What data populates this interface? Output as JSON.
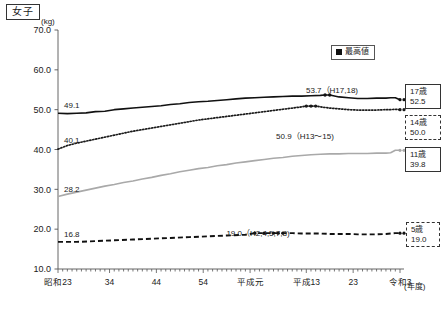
{
  "panel": {
    "title": "女子",
    "y_unit": "(kg)",
    "x_unit": "(年度)"
  },
  "legend": {
    "position": "top-right",
    "items": [
      {
        "label": "最高値",
        "marker": "filled-square",
        "color": "#111111"
      }
    ]
  },
  "end_labels": [
    {
      "id": "box17",
      "age": "17歳",
      "value": "52.5",
      "style": "solid"
    },
    {
      "id": "box14",
      "age": "14歳",
      "value": "50.0",
      "style": "dashed"
    },
    {
      "id": "box11",
      "age": "11歳",
      "value": "39.8",
      "style": "solid"
    },
    {
      "id": "box5",
      "age": "5歳",
      "value": "19.0",
      "style": "dashed"
    }
  ],
  "start_labels": [
    {
      "series": "17歳",
      "value": "49.1"
    },
    {
      "series": "14歳",
      "value": "40.1"
    },
    {
      "series": "11歳",
      "value": "28.2"
    },
    {
      "series": "5歳",
      "value": "16.8"
    }
  ],
  "annotations": [
    {
      "text": "53.7（H17,18)",
      "series": "17歳"
    },
    {
      "text": "50.9（H13〜15)",
      "series": "14歳"
    },
    {
      "text": "19.0（H2,4,5,7,8)",
      "series": "5歳"
    }
  ],
  "chart_data": {
    "type": "line",
    "title": "女子",
    "xlabel": "(年度)",
    "ylabel": "(kg)",
    "ylim": [
      10.0,
      70.0
    ],
    "ytick_labels": [
      "70.0",
      "60.0",
      "50.0",
      "40.0",
      "30.0",
      "20.0",
      "10.0"
    ],
    "ytick_values": [
      70.0,
      60.0,
      50.0,
      40.0,
      30.0,
      20.0,
      10.0
    ],
    "grid": false,
    "legend_position": "top-right",
    "xtick_labels": [
      "昭和23",
      "34",
      "44",
      "54",
      "平成元",
      "平成13",
      "23",
      "令和3"
    ],
    "xtick_years": [
      1948,
      1959,
      1969,
      1979,
      1989,
      2001,
      2011,
      2021
    ],
    "xlim": [
      1948,
      2021
    ],
    "series": [
      {
        "name": "17歳",
        "style": "solid",
        "color": "#111111",
        "start_value": 49.1,
        "end_value": 52.5,
        "peak_label": "53.7（H17,18)",
        "x": [
          1948,
          1950,
          1952,
          1954,
          1956,
          1958,
          1960,
          1962,
          1964,
          1966,
          1968,
          1970,
          1972,
          1974,
          1976,
          1978,
          1980,
          1982,
          1984,
          1986,
          1988,
          1990,
          1992,
          1994,
          1996,
          1998,
          2000,
          2002,
          2004,
          2005,
          2006,
          2008,
          2010,
          2012,
          2014,
          2016,
          2018,
          2019,
          2020,
          2021
        ],
        "values": [
          49.1,
          49.0,
          49.1,
          49.2,
          49.5,
          49.6,
          50.0,
          50.2,
          50.4,
          50.6,
          50.8,
          51.0,
          51.3,
          51.5,
          51.8,
          52.0,
          52.1,
          52.3,
          52.5,
          52.7,
          52.9,
          53.0,
          53.1,
          53.2,
          53.3,
          53.4,
          53.4,
          53.5,
          53.6,
          53.7,
          53.7,
          53.2,
          53.0,
          52.8,
          52.8,
          52.9,
          52.9,
          53.0,
          53.0,
          52.5
        ]
      },
      {
        "name": "14歳",
        "style": "dotted",
        "color": "#1a1a1a",
        "start_value": 40.1,
        "end_value": 50.0,
        "peak_label": "50.9（H13〜15)",
        "x": [
          1948,
          1950,
          1952,
          1954,
          1956,
          1958,
          1960,
          1962,
          1964,
          1966,
          1968,
          1970,
          1972,
          1974,
          1976,
          1978,
          1980,
          1982,
          1984,
          1986,
          1988,
          1990,
          1992,
          1994,
          1996,
          1998,
          2000,
          2001,
          2002,
          2003,
          2004,
          2006,
          2008,
          2010,
          2012,
          2014,
          2016,
          2018,
          2019,
          2020,
          2021
        ],
        "values": [
          40.1,
          41.0,
          41.6,
          42.1,
          42.6,
          43.1,
          43.6,
          44.1,
          44.6,
          45.0,
          45.4,
          45.8,
          46.2,
          46.6,
          47.0,
          47.4,
          47.7,
          48.0,
          48.3,
          48.6,
          48.9,
          49.2,
          49.5,
          49.8,
          50.1,
          50.4,
          50.7,
          50.9,
          50.9,
          50.9,
          50.7,
          50.4,
          50.2,
          50.0,
          49.9,
          49.9,
          49.9,
          50.0,
          50.0,
          50.1,
          50.0
        ]
      },
      {
        "name": "11歳",
        "style": "solid",
        "color": "#a9a9a9",
        "start_value": 28.2,
        "end_value": 39.8,
        "x": [
          1948,
          1950,
          1952,
          1954,
          1956,
          1958,
          1960,
          1962,
          1964,
          1966,
          1968,
          1970,
          1972,
          1974,
          1976,
          1978,
          1980,
          1982,
          1984,
          1986,
          1988,
          1990,
          1992,
          1994,
          1996,
          1998,
          2000,
          2002,
          2004,
          2006,
          2008,
          2010,
          2012,
          2014,
          2016,
          2018,
          2019,
          2020,
          2021
        ],
        "values": [
          28.2,
          28.8,
          29.3,
          29.8,
          30.3,
          30.8,
          31.2,
          31.7,
          32.1,
          32.6,
          33.0,
          33.5,
          33.9,
          34.4,
          34.8,
          35.2,
          35.5,
          35.9,
          36.2,
          36.6,
          36.9,
          37.2,
          37.5,
          37.8,
          38.0,
          38.3,
          38.5,
          38.7,
          38.8,
          38.9,
          38.9,
          39.0,
          39.0,
          39.0,
          39.1,
          39.1,
          39.2,
          39.8,
          39.8
        ]
      },
      {
        "name": "5歳",
        "style": "dashed",
        "color": "#111111",
        "start_value": 16.8,
        "end_value": 19.0,
        "peak_label": "19.0（H2,4,5,7,8)",
        "x": [
          1948,
          1952,
          1956,
          1960,
          1964,
          1968,
          1972,
          1976,
          1980,
          1984,
          1988,
          1990,
          1992,
          1994,
          1995,
          1996,
          1997,
          1998,
          2000,
          2002,
          2004,
          2006,
          2008,
          2010,
          2012,
          2014,
          2016,
          2018,
          2019,
          2020,
          2021
        ],
        "values": [
          16.8,
          16.8,
          17.0,
          17.2,
          17.4,
          17.6,
          17.8,
          18.0,
          18.2,
          18.4,
          18.6,
          19.0,
          19.0,
          19.0,
          19.0,
          19.0,
          19.0,
          19.0,
          18.9,
          18.9,
          18.9,
          18.8,
          18.8,
          18.8,
          18.7,
          18.7,
          18.7,
          18.8,
          18.9,
          19.0,
          19.0
        ]
      }
    ]
  }
}
